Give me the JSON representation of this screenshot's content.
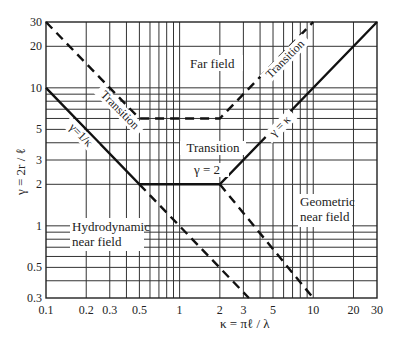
{
  "chart_data": {
    "type": "line",
    "title": "",
    "xlabel": "κ = πℓ / λ",
    "ylabel": "γ = 2r / ℓ",
    "xscale": "log",
    "yscale": "log",
    "xlim": [
      0.1,
      30
    ],
    "ylim": [
      0.3,
      30
    ],
    "grid": true,
    "x_ticks": [
      0.1,
      0.2,
      0.3,
      0.5,
      1,
      2,
      3,
      5,
      10,
      20,
      30
    ],
    "x_tick_labels": [
      "0.1",
      "0.2",
      "0.3",
      "0.5",
      "1",
      "2",
      "3",
      "5",
      "10",
      "20",
      "30"
    ],
    "y_ticks": [
      0.3,
      0.5,
      1,
      2,
      3,
      5,
      10,
      20,
      30
    ],
    "y_tick_labels": [
      "0.3",
      "0.5",
      "1",
      "2",
      "3",
      "5",
      "10",
      "20",
      "30"
    ],
    "x_grid": [
      0.2,
      0.3,
      0.4,
      0.5,
      0.6,
      0.7,
      0.8,
      0.9,
      1,
      2,
      3,
      4,
      5,
      6,
      7,
      8,
      9,
      10,
      20
    ],
    "y_grid": [
      0.4,
      0.5,
      0.6,
      0.7,
      0.8,
      0.9,
      1,
      2,
      3,
      4,
      5,
      6,
      7,
      8,
      9,
      10,
      20
    ],
    "series": [
      {
        "name": "Near/transition boundary (solid)",
        "style": "solid",
        "points": [
          [
            0.1,
            10
          ],
          [
            0.5,
            2
          ],
          [
            2,
            2
          ],
          [
            30,
            30
          ]
        ]
      },
      {
        "name": "Far field boundary (dashed)",
        "style": "dashed",
        "points": [
          [
            0.1,
            30
          ],
          [
            0.5,
            6
          ],
          [
            2,
            6
          ],
          [
            10,
            30
          ]
        ]
      },
      {
        "name": "Geometric boundary lower (dashed)",
        "style": "dashed",
        "points": [
          [
            0.5,
            2
          ],
          [
            3.3,
            0.3
          ]
        ]
      },
      {
        "name": "Geometric boundary upper (dashed)",
        "style": "dashed",
        "points": [
          [
            2,
            2
          ],
          [
            10,
            0.3
          ]
        ]
      }
    ],
    "annotations": [
      {
        "text": "Far field",
        "x": 1.2,
        "y": 17
      },
      {
        "text": "Transition",
        "x": 0.28,
        "y": 5,
        "rotation": 45
      },
      {
        "text": "Transition",
        "x": 5.5,
        "y": 15,
        "rotation": -45
      },
      {
        "text": "γ=1/κ",
        "x": 0.22,
        "y": 4,
        "rotation": 45
      },
      {
        "text": "γ = κ",
        "x": 5,
        "y": 4.5,
        "rotation": -45
      },
      {
        "text": "Transition",
        "x": 1.2,
        "y": 3.1
      },
      {
        "text": "γ = 2",
        "x": 1.2,
        "y": 2.3
      },
      {
        "text": "Hydrodynamic",
        "x": 0.3,
        "y": 1.05
      },
      {
        "text": "near field",
        "x": 0.3,
        "y": 0.9
      },
      {
        "text": "Geometric",
        "x": 11,
        "y": 1.5
      },
      {
        "text": "near field",
        "x": 11,
        "y": 1.25
      }
    ]
  },
  "labels": {
    "xlabel": "κ = πℓ / λ",
    "ylabel": "γ = 2r / ℓ",
    "far_field": "Far field",
    "transition_left": "Transition",
    "transition_right": "Transition",
    "transition_mid": "Transition",
    "gamma_inv": "γ=1/κ",
    "gamma_eq": "γ = κ",
    "gamma_2": "γ = 2",
    "hydro_1": "Hydrodynamic",
    "hydro_2": "near field",
    "geo_1": "Geometric",
    "geo_2": "near field"
  }
}
